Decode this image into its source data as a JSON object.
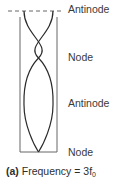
{
  "diagram": {
    "labels": {
      "top": "Antinode",
      "upper_middle": "Node",
      "lower_middle": "Antinode",
      "bottom": "Node"
    },
    "caption": {
      "part": "(a)",
      "text": "Frequency = 3f",
      "subscript": "0"
    },
    "colors": {
      "tube": "#555555",
      "wave": "#2a2a2a",
      "dashed": "#555555",
      "text": "#3a3a3a"
    }
  }
}
